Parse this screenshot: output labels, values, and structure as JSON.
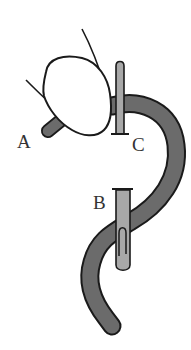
{
  "diagram": {
    "labels": {
      "a": "A",
      "b": "B",
      "c": "C"
    },
    "colors": {
      "background": "#ffffff",
      "outline": "#1a1a1a",
      "tube_dark": "#6b6b6b",
      "tube_light": "#a8a8a8",
      "bladder_fill": "#ffffff"
    }
  }
}
